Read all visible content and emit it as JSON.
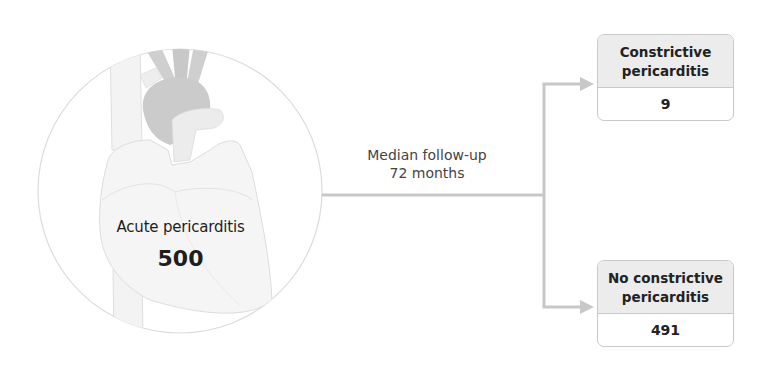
{
  "diagram": {
    "type": "flow",
    "cohort": {
      "label": "Acute pericarditis",
      "count": "500",
      "illustration": "heart-illustration"
    },
    "connector": {
      "label_line1": "Median follow-up",
      "label_line2": "72 months"
    },
    "outcomes": [
      {
        "label_line1": "Constrictive",
        "label_line2": "pericarditis",
        "count": "9"
      },
      {
        "label_line1": "No constrictive",
        "label_line2": "pericarditis",
        "count": "491"
      }
    ],
    "colors": {
      "connector": "#c8c8c8",
      "box_border": "#c9c9c9",
      "box_header": "#ececec",
      "circle_border": "#dcdcdc",
      "heart_fill": "#f4f4f4",
      "vessel_dark": "#cfcfcf"
    }
  }
}
